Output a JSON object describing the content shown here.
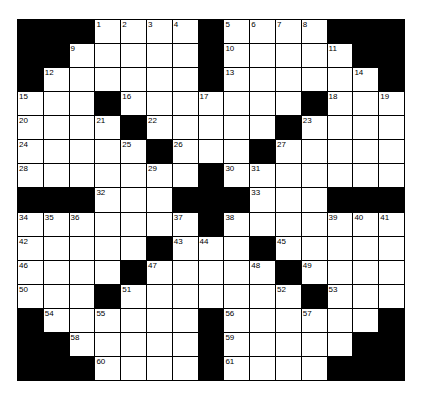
{
  "puzzle": {
    "rows": 15,
    "cols": 15,
    "grid": [
      "###1234#5678###",
      "##9....#10...11##",
      "#12.....#13....14#",
      "15..#16..17...#18.19",
      "20..21#22....#23...",
      "24...25#26..#27....",
      "28....29.#3031.....",
      "###32..###33..###",
      "343536...37#38...394041",
      "42....#4344.#45....",
      "46...#47...48#49...",
      "50..#51.....52#53..",
      "#54.55...#56..57..#",
      "##58....#59....##",
      "###60...#61...###"
    ],
    "cells": [
      [
        "#",
        "#",
        "#",
        1,
        2,
        3,
        4,
        "#",
        5,
        6,
        7,
        8,
        "#",
        "#",
        "#"
      ],
      [
        "#",
        "#",
        9,
        "",
        "",
        "",
        "",
        "#",
        10,
        "",
        "",
        "",
        11,
        "#",
        "#"
      ],
      [
        "#",
        12,
        "",
        "",
        "",
        "",
        "",
        "#",
        13,
        "",
        "",
        "",
        "",
        14,
        "#"
      ],
      [
        15,
        "",
        "",
        "#",
        16,
        "",
        "",
        17,
        "",
        "",
        "",
        "#",
        18,
        "",
        19
      ],
      [
        20,
        "",
        "",
        21,
        "#",
        22,
        "",
        "",
        "",
        "",
        "#",
        23,
        "",
        "",
        ""
      ],
      [
        24,
        "",
        "",
        "",
        25,
        "#",
        26,
        "",
        "",
        "#",
        27,
        "",
        "",
        "",
        ""
      ],
      [
        28,
        "",
        "",
        "",
        "",
        29,
        "",
        "#",
        30,
        31,
        "",
        "",
        "",
        "",
        ""
      ],
      [
        "#",
        "#",
        "#",
        32,
        "",
        "",
        "#",
        "#",
        "#",
        33,
        "",
        "",
        "#",
        "#",
        "#"
      ],
      [
        34,
        35,
        36,
        "",
        "",
        "",
        37,
        "#",
        38,
        "",
        "",
        "",
        39,
        40,
        41
      ],
      [
        42,
        "",
        "",
        "",
        "",
        "#",
        43,
        44,
        "",
        "#",
        45,
        "",
        "",
        "",
        ""
      ],
      [
        46,
        "",
        "",
        "",
        "#",
        47,
        "",
        "",
        "",
        48,
        "#",
        49,
        "",
        "",
        ""
      ],
      [
        50,
        "",
        "",
        "#",
        51,
        "",
        "",
        "",
        "",
        "",
        52,
        "#",
        53,
        "",
        ""
      ],
      [
        "#",
        54,
        "",
        55,
        "",
        "",
        "",
        "#",
        56,
        "",
        "",
        57,
        "",
        "",
        "#"
      ],
      [
        "#",
        "#",
        58,
        "",
        "",
        "",
        "",
        "#",
        59,
        "",
        "",
        "",
        "",
        "#",
        "#"
      ],
      [
        "#",
        "#",
        "#",
        60,
        "",
        "",
        "",
        "#",
        61,
        "",
        "",
        "",
        "#",
        "#",
        "#"
      ]
    ]
  }
}
